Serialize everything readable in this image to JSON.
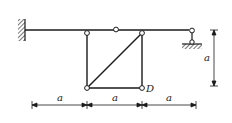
{
  "diagram": {
    "type": "structural-frame",
    "colors": {
      "stroke": "#1a1a1a",
      "background": "#ffffff"
    },
    "supports": {
      "left": "fixed-wall",
      "right": "pinned-link-on-ground"
    },
    "labels": {
      "node_D": "D",
      "dim_h1": "a",
      "dim_h2": "a",
      "dim_h3": "a",
      "dim_v": "a"
    }
  }
}
